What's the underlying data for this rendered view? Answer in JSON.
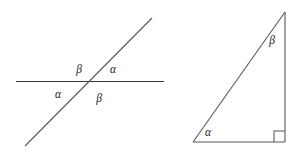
{
  "figure": {
    "background_color": "#ffffff",
    "stroke_color": "#3a3a3a",
    "soft_stroke_color": "#585858",
    "label_color": "#1a1a1a",
    "panels": [
      {
        "name": "intersecting-lines",
        "description": "Two intersecting straight lines forming vertical and supplementary angle pairs",
        "labels": [
          {
            "id": "beta-upper-left",
            "text": "β",
            "x": 79,
            "y": 70
          },
          {
            "id": "alpha-upper-right",
            "text": "α",
            "x": 113,
            "y": 70
          },
          {
            "id": "alpha-lower-left",
            "text": "α",
            "x": 58,
            "y": 95
          },
          {
            "id": "beta-lower-right",
            "text": "β",
            "x": 99,
            "y": 99
          }
        ],
        "geometry": {
          "horizontal_line": {
            "x1": 16,
            "y1": 81.5,
            "x2": 164,
            "y2": 81.5
          },
          "diagonal_line": {
            "x1": 25,
            "y1": 146,
            "x2": 152,
            "y2": 18
          },
          "intersection": {
            "x": 89,
            "y": 82
          }
        }
      },
      {
        "name": "right-triangle",
        "description": "Right triangle with acute angles alpha at the base-left vertex and beta at the apex",
        "labels": [
          {
            "id": "beta-apex",
            "text": "β",
            "x": 272,
            "y": 41
          },
          {
            "id": "alpha-base",
            "text": "α",
            "x": 208,
            "y": 133
          }
        ],
        "geometry": {
          "vertex_apex": {
            "x": 285,
            "y": 12
          },
          "vertex_bottom_right": {
            "x": 285,
            "y": 142
          },
          "vertex_bottom_left": {
            "x": 193,
            "y": 142
          },
          "right_angle_marker": {
            "x": 274,
            "y": 131,
            "size": 11
          }
        }
      }
    ]
  }
}
